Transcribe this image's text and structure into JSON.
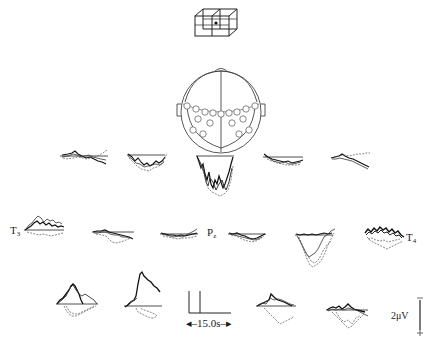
{
  "figure": {
    "type": "EEG slow cortical potential averaged waveforms at scalp electrode sites",
    "cube_icon": "3d-grid-cube-icon",
    "head_map": "electrode-head-map-icon",
    "electrode_labels": {
      "T3": {
        "main": "T",
        "sub": "3"
      },
      "Pz": {
        "main": "P",
        "sub": "z"
      },
      "T4": {
        "main": "T",
        "sub": "4"
      }
    },
    "time_scale": {
      "label": "15.0 s",
      "text": "15.0s"
    },
    "voltage_scale": {
      "label": "2 µV",
      "text": "2μV",
      "top_sign": "−",
      "bottom_sign": "+"
    }
  },
  "rows": [
    {
      "row": 1,
      "traces": [
        "frontal-1",
        "frontal-2",
        "frontal-center",
        "frontal-4",
        "frontal-5"
      ]
    },
    {
      "row": 2,
      "traces": [
        "T3",
        "central-2",
        "central-3",
        "Pz",
        "central-5",
        "T4"
      ]
    },
    {
      "row": 3,
      "traces": [
        "parietal-1",
        "parietal-2",
        "parietal-4",
        "parietal-5"
      ]
    }
  ]
}
